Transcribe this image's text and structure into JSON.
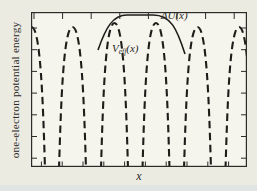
{
  "figure": {
    "xlabel": "x",
    "ylabel": "one-electron potential energy",
    "labels": {
      "delta_u": "ΔU(x)",
      "veff_prefix": "V",
      "veff_sub": "eff",
      "veff_suffix": "(x)"
    }
  },
  "colors": {
    "page_bg": "#ecebe2",
    "plot_bg": "#f5f4ed",
    "bottom_strip": "#e0e5e4",
    "frame": "#2b2b28",
    "curve": "#1e1d1a",
    "text": "#2a2926"
  },
  "chart_data": {
    "type": "line",
    "title": "",
    "xlabel": "x",
    "ylabel": "one-electron potential energy",
    "axis_values": "qualitative sketch; axes unlabeled numerically, short inward tick marks on all four sides of the frame",
    "legend_position": "inline-annotations",
    "series": [
      {
        "name": "V_eff(x)",
        "line_style": "dashed",
        "role": "periodic effective one-electron crystal potential: deep narrow wells at ion sites separated by tall rounded barriers",
        "peak_centers_x": [
          0.5,
          41.5,
          83.5,
          125,
          166.5,
          208
        ],
        "peak_apex_y": [
          15,
          15,
          11,
          11,
          15,
          15
        ],
        "peak_half_width": 13.5,
        "well_depth_y": 157
      },
      {
        "name": "ΔU(x)",
        "line_style": "solid",
        "role": "impurity perturbation potential with a flat top bridging the two central barriers",
        "path_points": {
          "x_start": 67,
          "y_start": 38,
          "plateau_x1": 96,
          "plateau_x2": 122,
          "plateau_y": 3,
          "x_end": 154,
          "y_end": 42
        }
      }
    ],
    "frame": {
      "width": 216,
      "height": 155
    },
    "ticks": {
      "top": {
        "count": 8,
        "start": 3,
        "step": 28.6,
        "len": 6
      },
      "bottom": {
        "count": 10,
        "start": 10.4,
        "step": 20.8,
        "len": 4.5
      },
      "left": {
        "count": 7,
        "start": 16,
        "step": 21.7,
        "len": 5
      },
      "right": {
        "count": 7,
        "start": 16,
        "step": 21.7,
        "len": 5
      }
    },
    "curve_stroke_width": 2.1,
    "dash_pattern": "7.5 4.5"
  }
}
